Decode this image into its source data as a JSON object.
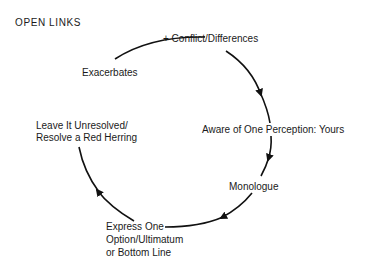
{
  "diagram": {
    "title": "OPEN LINKS",
    "type": "cycle",
    "nodes": [
      {
        "id": "conflict",
        "text": "+ Conflict/Differences"
      },
      {
        "id": "aware",
        "text": "Aware of One Perception:  Yours"
      },
      {
        "id": "monologue",
        "text": "Monologue"
      },
      {
        "id": "express",
        "lines": [
          "Express One",
          "Option/Ultimatum",
          "or Bottom Line"
        ]
      },
      {
        "id": "leave",
        "lines": [
          "Leave It Unresolved/",
          "Resolve a Red Herring"
        ]
      },
      {
        "id": "exacerbates",
        "text": "Exacerbates"
      }
    ],
    "edges": [
      {
        "from": "exacerbates",
        "to": "conflict"
      },
      {
        "from": "conflict",
        "to": "aware"
      },
      {
        "from": "aware",
        "to": "monologue"
      },
      {
        "from": "monologue",
        "to": "express"
      },
      {
        "from": "express",
        "to": "leave"
      },
      {
        "from": "leave",
        "to": "exacerbates"
      }
    ]
  }
}
